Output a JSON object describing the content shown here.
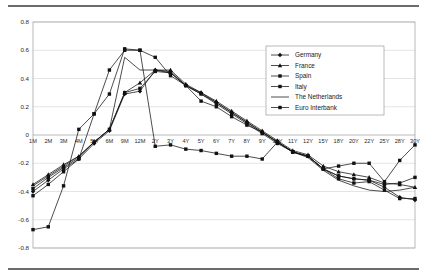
{
  "chart_data": {
    "type": "line",
    "title": "",
    "xlabel": "",
    "ylabel": "",
    "ylim": [
      -0.8,
      0.8
    ],
    "ytick_step": 0.2,
    "yticks": [
      "0.8",
      "0.6",
      "0.4",
      "0.2",
      "0",
      "-0.2",
      "-0.4",
      "-0.6",
      "-0.8"
    ],
    "grid": true,
    "legend_position": "upper-right",
    "categories": [
      "1M",
      "2M",
      "3M",
      "4M",
      "5M",
      "6M",
      "9M",
      "12M",
      "2Y",
      "3Y",
      "4Y",
      "5Y",
      "6Y",
      "7Y",
      "8Y",
      "9Y",
      "10Y",
      "11Y",
      "12Y",
      "15Y",
      "18Y",
      "20Y",
      "22Y",
      "25Y",
      "28Y",
      "30Y"
    ],
    "series": [
      {
        "name": "Germany",
        "marker": "diamond",
        "values": [
          -0.4,
          -0.32,
          -0.24,
          -0.17,
          -0.06,
          0.03,
          0.29,
          0.31,
          0.46,
          0.45,
          0.35,
          0.3,
          0.23,
          0.16,
          0.09,
          0.02,
          -0.05,
          -0.12,
          -0.15,
          -0.24,
          -0.29,
          -0.31,
          -0.32,
          -0.37,
          -0.44,
          -0.46
        ]
      },
      {
        "name": "France",
        "marker": "triangle",
        "values": [
          -0.35,
          -0.28,
          -0.21,
          -0.15,
          -0.05,
          0.04,
          0.3,
          0.37,
          0.46,
          0.46,
          0.36,
          0.3,
          0.24,
          0.17,
          0.1,
          0.03,
          -0.04,
          -0.11,
          -0.14,
          -0.22,
          -0.26,
          -0.28,
          -0.3,
          -0.34,
          -0.35,
          -0.37
        ]
      },
      {
        "name": "Spain",
        "marker": "square",
        "values": [
          -0.38,
          -0.3,
          -0.23,
          -0.16,
          -0.05,
          0.04,
          0.3,
          0.33,
          0.45,
          0.44,
          0.35,
          0.29,
          0.22,
          0.15,
          0.08,
          0.01,
          -0.06,
          -0.12,
          -0.15,
          -0.24,
          -0.29,
          -0.31,
          -0.32,
          -0.35,
          -0.34,
          -0.3
        ]
      },
      {
        "name": "Italy",
        "marker": "square",
        "values": [
          -0.43,
          -0.35,
          -0.26,
          -0.17,
          0.15,
          0.29,
          0.61,
          0.6,
          0.55,
          0.42,
          0.35,
          0.24,
          0.2,
          0.13,
          0.07,
          0.02,
          -0.05,
          -0.12,
          -0.15,
          -0.24,
          -0.31,
          -0.34,
          -0.33,
          -0.39,
          -0.45,
          -0.45
        ]
      },
      {
        "name": "The Netherlands",
        "marker": "none",
        "values": [
          -0.36,
          -0.29,
          -0.22,
          -0.15,
          -0.05,
          0.04,
          0.55,
          0.46,
          0.46,
          0.44,
          0.35,
          0.29,
          0.23,
          0.16,
          0.09,
          0.02,
          -0.05,
          -0.12,
          -0.16,
          -0.25,
          -0.32,
          -0.36,
          -0.39,
          -0.4,
          -0.39,
          -0.37
        ]
      },
      {
        "name": "Euro Interbank",
        "marker": "square",
        "values": [
          -0.67,
          -0.65,
          -0.36,
          0.04,
          0.15,
          0.46,
          0.6,
          0.6,
          -0.08,
          -0.07,
          -0.1,
          -0.11,
          -0.13,
          -0.15,
          -0.15,
          -0.17,
          -0.05,
          -0.12,
          -0.15,
          -0.24,
          -0.22,
          -0.2,
          -0.2,
          -0.33,
          -0.18,
          -0.07
        ]
      }
    ]
  },
  "legend": {
    "items": [
      {
        "label": "Germany"
      },
      {
        "label": "France"
      },
      {
        "label": "Spain"
      },
      {
        "label": "Italy"
      },
      {
        "label": "The Netherlands"
      },
      {
        "label": "Euro Interbank"
      }
    ]
  }
}
